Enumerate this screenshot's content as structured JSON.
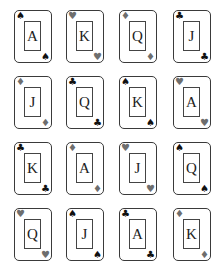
{
  "colors": {
    "black_suit": "#111111",
    "red_suit_rendered": "#6e6e6e",
    "border": "#3a3a3a"
  },
  "cards": [
    {
      "rank": "A",
      "suit": "spade",
      "glyph": "♠",
      "tone": "black"
    },
    {
      "rank": "K",
      "suit": "heart",
      "glyph": "♥",
      "tone": "gray"
    },
    {
      "rank": "Q",
      "suit": "diamond",
      "glyph": "♦",
      "tone": "gray"
    },
    {
      "rank": "J",
      "suit": "club",
      "glyph": "♣",
      "tone": "black"
    },
    {
      "rank": "J",
      "suit": "diamond",
      "glyph": "♦",
      "tone": "gray"
    },
    {
      "rank": "Q",
      "suit": "club",
      "glyph": "♣",
      "tone": "black"
    },
    {
      "rank": "K",
      "suit": "spade",
      "glyph": "♠",
      "tone": "black"
    },
    {
      "rank": "A",
      "suit": "heart",
      "glyph": "♥",
      "tone": "gray"
    },
    {
      "rank": "K",
      "suit": "club",
      "glyph": "♣",
      "tone": "black"
    },
    {
      "rank": "A",
      "suit": "diamond",
      "glyph": "♦",
      "tone": "gray"
    },
    {
      "rank": "J",
      "suit": "heart",
      "glyph": "♥",
      "tone": "gray"
    },
    {
      "rank": "Q",
      "suit": "spade",
      "glyph": "♠",
      "tone": "black"
    },
    {
      "rank": "Q",
      "suit": "heart",
      "glyph": "♥",
      "tone": "gray"
    },
    {
      "rank": "J",
      "suit": "spade",
      "glyph": "♠",
      "tone": "black"
    },
    {
      "rank": "A",
      "suit": "club",
      "glyph": "♣",
      "tone": "black"
    },
    {
      "rank": "K",
      "suit": "diamond",
      "glyph": "♦",
      "tone": "gray"
    }
  ]
}
